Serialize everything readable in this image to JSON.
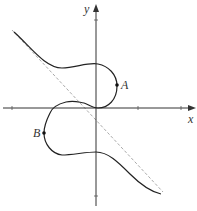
{
  "figure": {
    "type": "cubic curve with oblique asymptote",
    "axes": {
      "x_label": "x",
      "y_label": "y"
    },
    "points": [
      {
        "label": "A",
        "px": 117,
        "py": 85
      },
      {
        "label": "B",
        "px": 44,
        "py": 133
      }
    ],
    "colors": {
      "curve": "#222222",
      "axes": "#333333",
      "asymptote": "#aaaaaa",
      "background": "#ffffff"
    }
  }
}
